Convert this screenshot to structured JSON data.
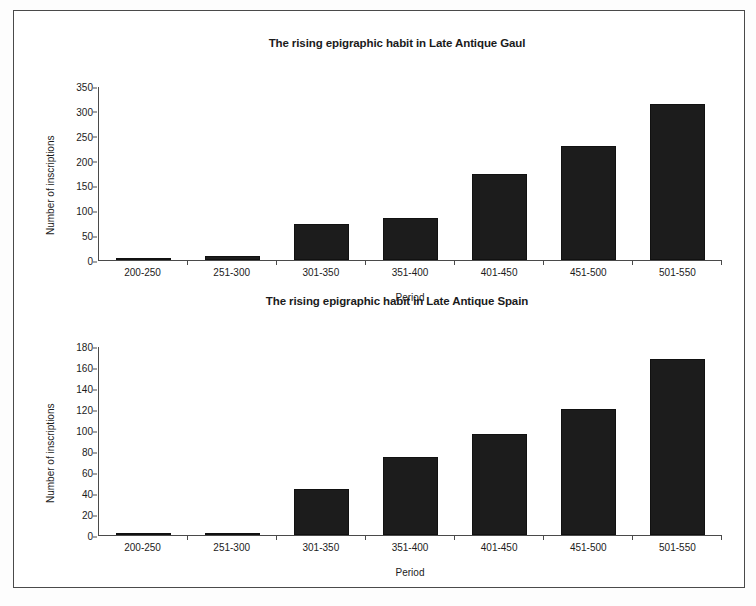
{
  "document": {
    "background_color": "#ffffff",
    "border_color": "#4a4a4a",
    "bar_color": "#1c1c1c"
  },
  "chart_data": [
    {
      "id": "gaul",
      "type": "bar",
      "title": "The rising epigraphic habit in Late Antique Gaul",
      "xlabel": "Period",
      "ylabel": "Number of inscriptions",
      "categories": [
        "200-250",
        "251-300",
        "301-350",
        "351-400",
        "401-450",
        "451-500",
        "501-550"
      ],
      "values": [
        3,
        8,
        72,
        84,
        173,
        229,
        314
      ],
      "ylim": [
        0,
        350
      ],
      "yticks": [
        0,
        50,
        100,
        150,
        200,
        250,
        300,
        350
      ],
      "grid": false,
      "legend": "none"
    },
    {
      "id": "spain",
      "type": "bar",
      "title": "The rising epigraphic habit in Late Antique Spain",
      "xlabel": "Period",
      "ylabel": "Number of inscriptions",
      "categories": [
        "200-250",
        "251-300",
        "301-350",
        "351-400",
        "401-450",
        "451-500",
        "501-550"
      ],
      "values": [
        1,
        2,
        44,
        74,
        96,
        120,
        168
      ],
      "ylim": [
        0,
        180
      ],
      "yticks": [
        0,
        20,
        40,
        60,
        80,
        100,
        120,
        140,
        160,
        180
      ],
      "grid": false,
      "legend": "none"
    }
  ]
}
